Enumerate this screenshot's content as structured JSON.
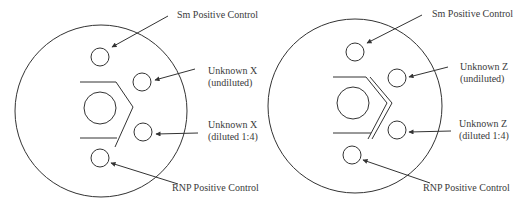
{
  "colors": {
    "line": "#333333",
    "text": "#3a3a3a",
    "background": "#ffffff"
  },
  "plates": [
    {
      "id": "left",
      "trough": "single",
      "labels": {
        "sm_control": "Sm Positive Control",
        "unknown_top_line1": "Unknown X",
        "unknown_top_line2": "(undiluted)",
        "unknown_bottom_line1": "Unknown X",
        "unknown_bottom_line2": "(diluted 1:4)",
        "rnp_control": "RNP Positive Control"
      }
    },
    {
      "id": "right",
      "trough": "double",
      "labels": {
        "sm_control": "Sm Positive Control",
        "unknown_top_line1": "Unknown Z",
        "unknown_top_line2": "(undiluted)",
        "unknown_bottom_line1": "Unknown Z",
        "unknown_bottom_line2": "(diluted 1:4)",
        "rnp_control": "RNP Positive Control"
      }
    }
  ]
}
